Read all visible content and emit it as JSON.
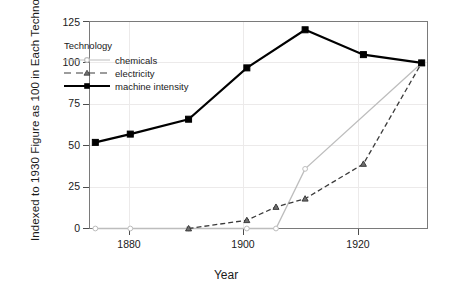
{
  "chart_data": {
    "type": "line",
    "title": "",
    "xlabel": "Year",
    "ylabel": "Indexed to 1930 Figure as 100 in Each Technology",
    "xlim": [
      1873,
      1931
    ],
    "ylim": [
      0,
      125
    ],
    "xticks": [
      1880,
      1900,
      1920
    ],
    "yticks": [
      0,
      25,
      50,
      75,
      100,
      125
    ],
    "grid": true,
    "legend_title": "Technology",
    "legend_position": "upper-left-inside",
    "series": [
      {
        "name": "chemicals",
        "color": "#bdbdbd",
        "linestyle": "solid",
        "marker": "circle",
        "x": [
          1874,
          1880,
          1890,
          1900,
          1905,
          1910,
          1930
        ],
        "values": [
          0,
          0,
          0,
          0,
          0,
          36,
          100
        ]
      },
      {
        "name": "electricity",
        "color": "#3b3b3b",
        "linestyle": "dashed",
        "marker": "triangle",
        "x": [
          1890,
          1900,
          1905,
          1910,
          1920,
          1930
        ],
        "values": [
          0,
          5,
          13,
          18,
          39,
          100
        ]
      },
      {
        "name": "machine intensity",
        "color": "#000000",
        "linestyle": "solid",
        "marker": "square",
        "x": [
          1874,
          1880,
          1890,
          1900,
          1910,
          1920,
          1930
        ],
        "values": [
          52,
          57,
          66,
          97,
          120,
          105,
          100
        ]
      }
    ]
  },
  "axes": {
    "y_title": "Indexed to 1930 Figure as 100 in Each Technology",
    "x_title": "Year",
    "y_tick_labels": [
      "0",
      "25",
      "50",
      "75",
      "100",
      "125"
    ],
    "x_tick_labels": [
      "1880",
      "1900",
      "1920"
    ]
  },
  "legend": {
    "title": "Technology",
    "items": [
      {
        "label": "chemicals"
      },
      {
        "label": "electricity"
      },
      {
        "label": "machine intensity"
      }
    ]
  },
  "colors": {
    "chemicals": "#bdbdbd",
    "electricity": "#3b3b3b",
    "machine_intensity": "#000000",
    "grid": "#eceaea",
    "frame": "#7a7a7a",
    "text": "#1a1a1a",
    "background": "#ffffff"
  }
}
